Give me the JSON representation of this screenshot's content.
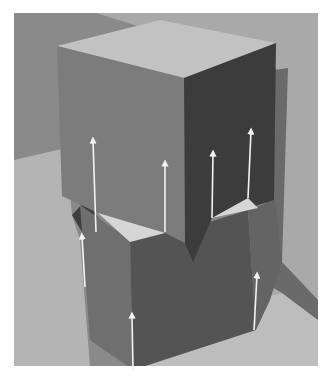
{
  "figure": {
    "colors": {
      "border": "#ffffff",
      "wall_back": "#8a8a8a",
      "wall_right": "#a9a9a9",
      "floor_left": "#b4b4b4",
      "floor_right": "#bdbdbd",
      "upper_top": "#c2c2c2",
      "upper_left": "#7c7c7c",
      "upper_right": "#3c3c3c",
      "lower_left": "#6f6f6f",
      "lower_front": "#545454",
      "lower_right": "#646464",
      "highlight_triangle": "#d6d6d6",
      "shadow": "#4a4a4a",
      "arrow": "#f2f2f2"
    },
    "arrows": [
      {
        "x1": 96,
        "y1": 232,
        "x2": 93,
        "y2": 140
      },
      {
        "x1": 165,
        "y1": 232,
        "x2": 165,
        "y2": 163
      },
      {
        "x1": 212,
        "y1": 218,
        "x2": 213,
        "y2": 153
      },
      {
        "x1": 248,
        "y1": 198,
        "x2": 251,
        "y2": 131
      },
      {
        "x1": 85,
        "y1": 287,
        "x2": 82,
        "y2": 236
      },
      {
        "x1": 133,
        "y1": 370,
        "x2": 132,
        "y2": 315
      },
      {
        "x1": 254,
        "y1": 330,
        "x2": 257,
        "y2": 275
      }
    ]
  }
}
